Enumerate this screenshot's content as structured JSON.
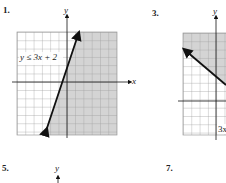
{
  "problems": [
    {
      "number": "1.",
      "label": "y ≤ 3x + 2",
      "x_axis": "x",
      "y_axis": "y"
    },
    {
      "number": "3.",
      "label": "3x",
      "y_axis": "y"
    },
    {
      "number": "5.",
      "y_axis": "y"
    },
    {
      "number": "7."
    }
  ],
  "colors": {
    "shade": "#d4d4d4",
    "grid": "#9a9a9a",
    "line": "#111111"
  }
}
